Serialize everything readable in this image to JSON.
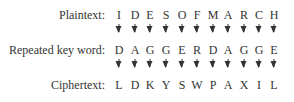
{
  "rows": {
    "plaintext": {
      "label": "Plaintext:",
      "letters": [
        "I",
        "D",
        "E",
        "S",
        "O",
        "F",
        "M",
        "A",
        "R",
        "C",
        "H"
      ]
    },
    "key": {
      "label": "Repeated key word:",
      "letters": [
        "D",
        "A",
        "G",
        "G",
        "E",
        "R",
        "D",
        "A",
        "G",
        "G",
        "E"
      ]
    },
    "ciphertext": {
      "label": "Ciphertext:",
      "letters": [
        "L",
        "D",
        "K",
        "Y",
        "S",
        "W",
        "P",
        "A",
        "X",
        "I",
        "L"
      ]
    }
  },
  "columns_x": [
    119,
    135,
    150,
    166,
    182,
    197,
    213,
    228,
    244,
    259,
    274
  ]
}
